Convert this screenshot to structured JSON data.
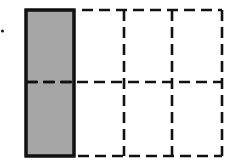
{
  "diagram": {
    "type": "fraction-grid",
    "rows": 2,
    "cols": 4,
    "shaded_columns": [
      0
    ],
    "shaded_cells": 2,
    "total_cells": 8,
    "fraction_shown": "2/8",
    "colors": {
      "shade": "#a6a6a6",
      "line": "#111111",
      "background": "#ffffff"
    },
    "marker": "•"
  }
}
